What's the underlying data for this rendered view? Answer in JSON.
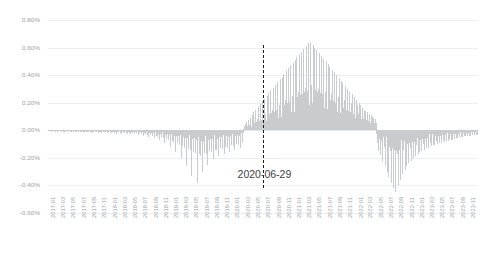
{
  "chart_data": {
    "type": "bar",
    "title": "",
    "xlabel": "",
    "ylabel": "",
    "ylim": [
      -0.6,
      0.8
    ],
    "ytick_labels": [
      "0.80%",
      "0.60%",
      "0.40%",
      "0.20%",
      "0.00%",
      "-0.20%",
      "-0.40%",
      "-0.60%"
    ],
    "ytick_values": [
      0.8,
      0.6,
      0.4,
      0.2,
      0.0,
      -0.2,
      -0.4,
      -0.6
    ],
    "grid": true,
    "legend": "none",
    "bar_color": "#c9cccf",
    "annotation": {
      "text": "2020-06-29",
      "line_style": "dashed",
      "line_color": "#1b1b1b",
      "x_value": "2020-06-29"
    },
    "xtick_labels": [
      "2017-01",
      "2017-03",
      "2017-05",
      "2017-07",
      "2017-09",
      "2017-11",
      "2018-01",
      "2018-03",
      "2018-05",
      "2018-07",
      "2018-09",
      "2018-11",
      "2019-01",
      "2019-03",
      "2019-05",
      "2019-07",
      "2019-09",
      "2019-11",
      "2020-01",
      "2020-03",
      "2020-05",
      "2020-07",
      "2020-09",
      "2020-11",
      "2021-01",
      "2021-03",
      "2021-05",
      "2021-07",
      "2021-09",
      "2021-11",
      "2022-01",
      "2022-03",
      "2022-05",
      "2022-07",
      "2022-09",
      "2022-11",
      "2023-01",
      "2023-03",
      "2023-05",
      "2023-07",
      "2023-09",
      "2023-11"
    ],
    "x_range": [
      "2017-01",
      "2023-12"
    ],
    "series_name": "daily value",
    "values": [
      -0.004,
      -0.002,
      -0.006,
      -0.003,
      -0.008,
      -0.002,
      -0.005,
      -0.01,
      -0.003,
      -0.006,
      -0.002,
      -0.009,
      -0.004,
      -0.007,
      -0.003,
      -0.012,
      -0.005,
      -0.002,
      -0.008,
      -0.004,
      -0.006,
      -0.011,
      -0.003,
      -0.007,
      -0.002,
      -0.009,
      -0.005,
      -0.013,
      -0.004,
      -0.008,
      -0.003,
      -0.006,
      -0.01,
      -0.004,
      -0.007,
      -0.002,
      -0.014,
      -0.005,
      -0.009,
      -0.003,
      -0.008,
      -0.004,
      -0.011,
      -0.006,
      -0.002,
      -0.01,
      -0.005,
      -0.015,
      -0.003,
      -0.008,
      -0.006,
      -0.012,
      -0.004,
      -0.009,
      -0.003,
      -0.007,
      -0.014,
      -0.005,
      -0.01,
      -0.004,
      -0.008,
      -0.016,
      -0.006,
      -0.011,
      -0.003,
      -0.009,
      -0.005,
      -0.013,
      -0.007,
      -0.004,
      -0.012,
      -0.006,
      -0.018,
      -0.005,
      -0.01,
      -0.004,
      -0.015,
      -0.008,
      -0.006,
      -0.011,
      -0.003,
      -0.014,
      -0.007,
      -0.005,
      -0.017,
      -0.009,
      -0.006,
      -0.012,
      -0.004,
      -0.02,
      -0.008,
      -0.005,
      -0.013,
      -0.007,
      -0.016,
      -0.006,
      -0.01,
      -0.004,
      -0.019,
      -0.009,
      -0.006,
      -0.014,
      -0.008,
      -0.005,
      -0.022,
      -0.011,
      -0.007,
      -0.015,
      -0.006,
      -0.01,
      -0.018,
      -0.008,
      -0.005,
      -0.013,
      -0.024,
      -0.009,
      -0.006,
      -0.016,
      -0.01,
      -0.007,
      -0.02,
      -0.012,
      -0.006,
      -0.026,
      -0.009,
      -0.014,
      -0.007,
      -0.018,
      -0.01,
      -0.005,
      -0.022,
      -0.011,
      -0.008,
      -0.03,
      -0.013,
      -0.007,
      -0.017,
      -0.01,
      -0.024,
      -0.012,
      -0.008,
      -0.019,
      -0.011,
      -0.006,
      -0.028,
      -0.014,
      -0.009,
      -0.021,
      -0.012,
      -0.007,
      -0.034,
      -0.016,
      -0.01,
      -0.023,
      -0.013,
      -0.008,
      -0.026,
      -0.015,
      -0.011,
      -0.04,
      -0.018,
      -0.012,
      -0.029,
      -0.016,
      -0.009,
      -0.032,
      -0.019,
      -0.013,
      -0.046,
      -0.021,
      -0.014,
      -0.035,
      -0.018,
      -0.011,
      -0.038,
      -0.022,
      -0.015,
      -0.055,
      -0.024,
      -0.016,
      -0.042,
      -0.02,
      -0.013,
      -0.048,
      -0.026,
      -0.018,
      -0.07,
      -0.028,
      -0.019,
      -0.052,
      -0.024,
      -0.015,
      -0.058,
      -0.031,
      -0.021,
      -0.09,
      -0.033,
      -0.022,
      -0.064,
      -0.029,
      -0.018,
      -0.072,
      -0.036,
      -0.024,
      -0.12,
      -0.038,
      -0.026,
      -0.08,
      -0.034,
      -0.021,
      -0.088,
      -0.042,
      -0.028,
      -0.16,
      -0.044,
      -0.03,
      -0.095,
      -0.04,
      -0.025,
      -0.105,
      -0.048,
      -0.032,
      -0.2,
      -0.05,
      -0.034,
      -0.115,
      -0.046,
      -0.029,
      -0.125,
      -0.054,
      -0.036,
      -0.26,
      -0.058,
      -0.038,
      -0.135,
      -0.052,
      -0.033,
      -0.145,
      -0.062,
      -0.04,
      -0.33,
      -0.066,
      -0.042,
      -0.155,
      -0.058,
      -0.036,
      -0.165,
      -0.07,
      -0.045,
      -0.38,
      -0.074,
      -0.048,
      -0.175,
      -0.064,
      -0.04,
      -0.185,
      -0.078,
      -0.05,
      -0.3,
      -0.082,
      -0.052,
      -0.165,
      -0.07,
      -0.044,
      -0.175,
      -0.074,
      -0.046,
      -0.25,
      -0.068,
      -0.042,
      -0.15,
      -0.062,
      -0.038,
      -0.16,
      -0.066,
      -0.04,
      -0.21,
      -0.058,
      -0.036,
      -0.14,
      -0.054,
      -0.034,
      -0.145,
      -0.06,
      -0.038,
      -0.19,
      -0.052,
      -0.032,
      -0.13,
      -0.048,
      -0.03,
      -0.135,
      -0.056,
      -0.035,
      -0.175,
      -0.046,
      -0.028,
      -0.12,
      -0.044,
      -0.027,
      -0.125,
      -0.05,
      -0.031,
      -0.16,
      -0.042,
      -0.026,
      -0.11,
      -0.04,
      -0.024,
      -0.115,
      -0.046,
      -0.029,
      -0.145,
      -0.038,
      -0.023,
      -0.1,
      -0.036,
      -0.022,
      -0.105,
      -0.042,
      -0.026,
      -0.13,
      -0.034,
      -0.021,
      -0.095,
      -0.033,
      -0.02,
      0.012,
      0.03,
      0.018,
      0.045,
      0.022,
      0.06,
      0.028,
      0.015,
      0.075,
      0.035,
      0.02,
      0.09,
      0.04,
      0.024,
      0.11,
      0.048,
      0.028,
      0.13,
      0.055,
      0.032,
      0.15,
      0.062,
      0.036,
      0.08,
      0.042,
      0.17,
      0.07,
      0.04,
      0.19,
      0.078,
      0.045,
      0.21,
      0.085,
      0.05,
      0.23,
      0.095,
      0.055,
      0.12,
      0.065,
      0.25,
      0.105,
      0.06,
      0.27,
      0.115,
      0.068,
      0.29,
      0.125,
      0.072,
      0.15,
      0.08,
      0.31,
      0.135,
      0.078,
      0.33,
      0.145,
      0.085,
      0.35,
      0.155,
      0.09,
      0.18,
      0.1,
      0.37,
      0.165,
      0.095,
      0.39,
      0.175,
      0.105,
      0.41,
      0.185,
      0.11,
      0.22,
      0.125,
      0.43,
      0.195,
      0.115,
      0.45,
      0.205,
      0.12,
      0.47,
      0.215,
      0.13,
      0.25,
      0.14,
      0.49,
      0.225,
      0.135,
      0.51,
      0.235,
      0.145,
      0.53,
      0.245,
      0.15,
      0.28,
      0.16,
      0.55,
      0.255,
      0.155,
      0.57,
      0.265,
      0.165,
      0.59,
      0.275,
      0.17,
      0.31,
      0.18,
      0.61,
      0.285,
      0.175,
      0.63,
      0.295,
      0.185,
      0.64,
      0.305,
      0.19,
      0.33,
      0.2,
      0.62,
      0.3,
      0.185,
      0.6,
      0.29,
      0.18,
      0.58,
      0.28,
      0.175,
      0.3,
      0.19,
      0.56,
      0.27,
      0.17,
      0.54,
      0.26,
      0.165,
      0.52,
      0.25,
      0.16,
      0.28,
      0.175,
      0.5,
      0.24,
      0.155,
      0.48,
      0.23,
      0.15,
      0.46,
      0.22,
      0.145,
      0.26,
      0.165,
      0.44,
      0.21,
      0.14,
      0.42,
      0.2,
      0.135,
      0.4,
      0.19,
      0.13,
      0.24,
      0.155,
      0.38,
      0.18,
      0.125,
      0.36,
      0.17,
      0.12,
      0.34,
      0.16,
      0.115,
      0.22,
      0.145,
      0.32,
      0.15,
      0.11,
      0.3,
      0.14,
      0.105,
      0.28,
      0.13,
      0.1,
      0.2,
      0.135,
      0.26,
      0.12,
      0.095,
      0.24,
      0.11,
      0.09,
      0.22,
      0.1,
      0.085,
      0.18,
      0.12,
      0.2,
      0.09,
      0.08,
      0.18,
      0.085,
      0.075,
      0.16,
      0.08,
      0.07,
      0.15,
      0.105,
      0.14,
      0.075,
      0.065,
      0.13,
      0.07,
      0.06,
      0.12,
      0.065,
      0.055,
      0.11,
      0.09,
      0.1,
      0.06,
      0.05,
      0.09,
      0.055,
      0.045,
      0.08,
      0.05,
      -0.03,
      -0.09,
      -0.045,
      -0.15,
      -0.06,
      -0.035,
      -0.18,
      -0.075,
      -0.04,
      -0.22,
      -0.09,
      -0.048,
      -0.12,
      -0.062,
      -0.26,
      -0.1,
      -0.052,
      -0.3,
      -0.11,
      -0.058,
      -0.34,
      -0.12,
      -0.062,
      -0.15,
      -0.072,
      -0.38,
      -0.13,
      -0.066,
      -0.42,
      -0.14,
      -0.07,
      -0.45,
      -0.15,
      -0.075,
      -0.17,
      -0.082,
      -0.4,
      -0.14,
      -0.072,
      -0.36,
      -0.13,
      -0.068,
      -0.32,
      -0.12,
      -0.064,
      -0.145,
      -0.076,
      -0.29,
      -0.11,
      -0.06,
      -0.26,
      -0.1,
      -0.055,
      -0.24,
      -0.095,
      -0.05,
      -0.125,
      -0.066,
      -0.22,
      -0.088,
      -0.046,
      -0.2,
      -0.082,
      -0.044,
      -0.185,
      -0.076,
      -0.042,
      -0.11,
      -0.058,
      -0.17,
      -0.072,
      -0.04,
      -0.16,
      -0.068,
      -0.038,
      -0.15,
      -0.064,
      -0.036,
      -0.1,
      -0.054,
      -0.14,
      -0.06,
      -0.034,
      -0.13,
      -0.056,
      -0.032,
      -0.125,
      -0.052,
      -0.03,
      -0.09,
      -0.048,
      -0.115,
      -0.05,
      -0.029,
      -0.11,
      -0.046,
      -0.028,
      -0.105,
      -0.044,
      -0.027,
      -0.08,
      -0.042,
      -0.1,
      -0.04,
      -0.026,
      -0.095,
      -0.038,
      -0.025,
      -0.09,
      -0.036,
      -0.024,
      -0.07,
      -0.034,
      -0.085,
      -0.033,
      -0.023,
      -0.08,
      -0.032,
      -0.022,
      -0.075,
      -0.03,
      -0.021,
      -0.065,
      -0.029,
      -0.07,
      -0.028,
      -0.02,
      -0.068,
      -0.027,
      -0.019,
      -0.06,
      -0.026,
      -0.018,
      -0.058,
      -0.025,
      -0.055,
      -0.024,
      -0.017,
      -0.052,
      -0.023,
      -0.016,
      -0.05,
      -0.022,
      -0.015,
      -0.048,
      -0.021,
      -0.045,
      -0.02,
      -0.014,
      -0.044,
      -0.019,
      -0.013,
      -0.042,
      -0.018,
      -0.012,
      -0.04,
      -0.017,
      -0.038,
      -0.016,
      -0.011,
      -0.036,
      -0.015,
      -0.01,
      -0.035,
      -0.014,
      -0.009,
      -0.033,
      -0.013,
      -0.032,
      -0.012
    ]
  }
}
